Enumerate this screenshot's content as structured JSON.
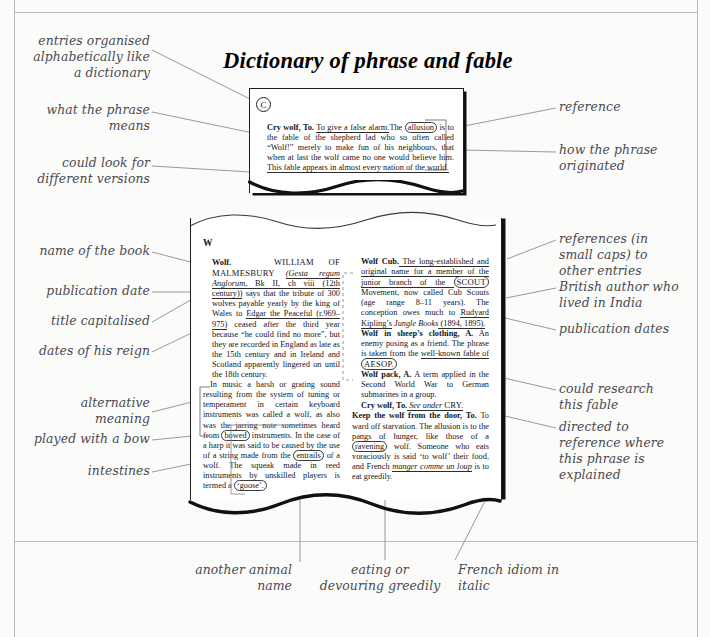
{
  "document": {
    "title": "Dictionary of phrase and fable",
    "letter_marker": "C",
    "section_letter": "W"
  },
  "entries": {
    "cry_wolf": {
      "headword": "Cry wolf, To.",
      "definition": "To give a false alarm.",
      "body_1": "The ",
      "circled_word": "allusion",
      "body_2": " is to the fable of the shepherd lad who so often called “Wolf!” merely to make fun of his neighbours, that when at last the wolf came no one would believe him. ",
      "underlined_tail": "This fable appears in almost every nation of the world."
    },
    "wolf": {
      "headword": "Wolf.",
      "smallcaps_author": "WILLIAM OF MALMESBURY",
      "italic_title": "(Gesta regum Anglorum,",
      "ref_rest": " Bk II, ch viii ",
      "date_paren": "(12th century))",
      "body_a": " says that the tribute of 300 wolves payable yearly by the king of Wales to ",
      "person": "Edgar the Peaceful",
      "reign": " (r.969–975)",
      "body_b": " ceased after the third year because “he could find no more”, but they are recorded in England as late as the 15th century and in Ireland and Scotland apparently lingered on until the 18th century.",
      "para2_lead": "In music a harsh or grating sound resulting from the system of tuning or temperament in certain keyboard instruments was called a wolf, as also was the jarring note sometimes heard from ",
      "circled_bowed": "bowed",
      "para2_mid": " instruments. In the case of a harp it was said to be caused by the use of a string made from the ",
      "circled_entrails": "entrails",
      "para2_tail": " of a wolf. The squeak made in reed instruments by unskilled players is termed a ",
      "circled_goose": "‘goose’."
    },
    "wolf_cub": {
      "headword": "Wolf Cub.",
      "body_1": " The long-established and original name for a member of the junior branch of the ",
      "circled_scout": "SCOUT",
      "body_2": " Movement, now called Cub Scouts (age range 8–11 years). The conception owes much to ",
      "author": "Rudyard Kipling’s",
      "italic_work": " Jungle Books",
      "dates": " (1894, 1895)."
    },
    "wolf_sheep": {
      "headword": "Wolf in sheep’s clothing, A.",
      "body_1": " An enemy posing as a friend. The phrase is taken from the ",
      "underlined": "well-known fable of",
      "circled_aesop": "AESOP."
    },
    "wolf_pack": {
      "headword": "Wolf pack, A.",
      "body": " A term applied in the Second World War to German submarines in a group."
    },
    "cry_wolf_ref": {
      "headword": "Cry wolf, To.",
      "italic_ref": " See under ",
      "smallcaps_ref": "CRY."
    },
    "keep_wolf": {
      "headword": "Keep the wolf from the door, To.",
      "body_1": " To ward off starvation. The allusion is to the pangs of hunger, like those of a ",
      "circled_ravening": "ravening",
      "body_2": " wolf. Someone who eats voraciously is said ‘to wolf’ their food, and French ",
      "french_idiom": "manger comme un loup",
      "body_3": " is to eat greedily."
    }
  },
  "annotations": {
    "left": [
      {
        "id": "entries-organised",
        "text": "entries organised\nalphabetically like\na dictionary"
      },
      {
        "id": "what-phrase-means",
        "text": "what the phrase\nmeans"
      },
      {
        "id": "different-versions",
        "text": "could look for\ndifferent versions"
      },
      {
        "id": "name-of-book",
        "text": "name of the book"
      },
      {
        "id": "publication-date",
        "text": "publication date"
      },
      {
        "id": "title-capitalised",
        "text": "title capitalised"
      },
      {
        "id": "dates-of-reign",
        "text": "dates of his reign"
      },
      {
        "id": "alternative-meaning",
        "text": "alternative\nmeaning"
      },
      {
        "id": "played-with-bow",
        "text": "played with a bow"
      },
      {
        "id": "intestines",
        "text": "intestines"
      }
    ],
    "right": [
      {
        "id": "reference",
        "text": "reference"
      },
      {
        "id": "how-phrase-originated",
        "text": "how the phrase\noriginated"
      },
      {
        "id": "references-small-caps",
        "text": "references (in\nsmall caps) to\nother entries"
      },
      {
        "id": "british-author",
        "text": "British author who\nlived in India"
      },
      {
        "id": "publication-dates",
        "text": "publication dates"
      },
      {
        "id": "could-research-fable",
        "text": "could research\nthis fable"
      },
      {
        "id": "directed-to-reference",
        "text": "directed to\nreference where\nthis phrase is\nexplained"
      }
    ],
    "bottom": [
      {
        "id": "another-animal-name",
        "text": "another animal\nname"
      },
      {
        "id": "eating-devouring",
        "text": "eating or\ndevouring greedily"
      },
      {
        "id": "french-idiom",
        "text": "French idiom in\nitalic"
      }
    ]
  },
  "colors": {
    "page_bg": "#fbfbfa",
    "sheet": "#ffffff",
    "annotation_text": "#4a4a50",
    "leader_line": "#8d8d95",
    "frame_line": "#b9b9b9",
    "ink": "#15151a"
  }
}
